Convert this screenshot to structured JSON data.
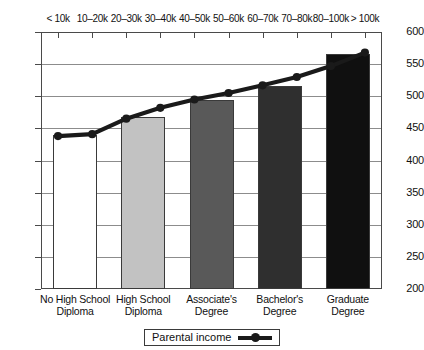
{
  "chart_data": {
    "type": "bar",
    "title": "",
    "subtitle": "",
    "xlabel": "",
    "ylabel": "",
    "ylim": [
      200,
      600
    ],
    "ytick_step": 50,
    "ytick_labels": [
      "600",
      "550",
      "500",
      "450",
      "400",
      "350",
      "300",
      "250",
      "200"
    ],
    "ytick_values": [
      600,
      550,
      500,
      450,
      400,
      350,
      300,
      250,
      200
    ],
    "grid": true,
    "grid_axis": "y",
    "legend_position": "bottom-center",
    "categories": [
      "No High School Diploma",
      "High School Diploma",
      "Associate's Degree",
      "Bachelor's Degree",
      "Graduate Degree"
    ],
    "category_lines": [
      [
        "No High School",
        "Diploma"
      ],
      [
        "High School",
        "Diploma"
      ],
      [
        "Associate's",
        "Degree"
      ],
      [
        "Bachelor's",
        "Degree"
      ],
      [
        "Graduate",
        "Degree"
      ]
    ],
    "values": [
      440,
      467,
      494,
      516,
      565
    ],
    "bar_colors": [
      "#ffffff",
      "#c2c2c2",
      "#595959",
      "#2f2f2f",
      "#101010"
    ],
    "top_axis": {
      "label": "Parental income",
      "tick_labels": [
        "< 10k",
        "10–20k",
        "20–30k",
        "30–40k",
        "40–50k",
        "50–60k",
        "60–70k",
        "70–80k",
        "80–100k",
        "> 100k"
      ]
    },
    "series": [
      {
        "name": "Parental income",
        "type": "line",
        "color": "#1a1a1a",
        "marker": "circle",
        "x": [
          "< 10k",
          "10–20k",
          "20–30k",
          "30–40k",
          "40–50k",
          "50–60k",
          "60–70k",
          "70–80k",
          "80–100k",
          "> 100k"
        ],
        "values": [
          438,
          441,
          465,
          482,
          495,
          505,
          517,
          530,
          547,
          568
        ]
      }
    ]
  },
  "legend": {
    "entries": [
      {
        "label": "Parental income",
        "symbol": "line-marker",
        "color": "#1a1a1a"
      }
    ]
  }
}
